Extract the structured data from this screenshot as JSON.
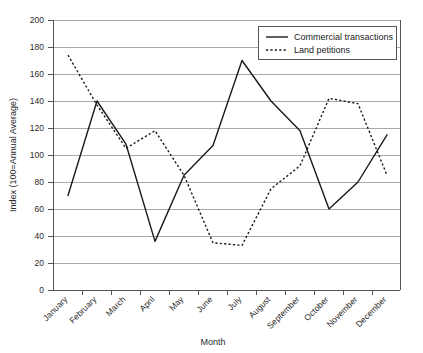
{
  "chart_data": {
    "type": "line",
    "title": "",
    "xlabel": "Month",
    "ylabel": "Index (100=Annual Average)",
    "categories": [
      "January",
      "February",
      "March",
      "April",
      "May",
      "June",
      "July",
      "August",
      "September",
      "October",
      "November",
      "December"
    ],
    "series": [
      {
        "name": "Commercial transactions",
        "style": "solid",
        "values": [
          70,
          140,
          108,
          36,
          85,
          107,
          170,
          140,
          118,
          60,
          80,
          115
        ]
      },
      {
        "name": "Land petitions",
        "style": "dotted",
        "values": [
          174,
          137,
          105,
          118,
          85,
          35,
          33,
          75,
          92,
          142,
          138,
          85
        ]
      }
    ],
    "ylim": [
      0,
      200
    ],
    "ytick_step": 20,
    "yticks": [
      "0",
      "20",
      "40",
      "60",
      "80",
      "100",
      "120",
      "140",
      "160",
      "180",
      "200"
    ],
    "grid": "horizontal",
    "legend_position": "top-right",
    "colors": {
      "series_line": "#1a1a1a",
      "gridline": "#a9a9a9",
      "axis": "#555555",
      "background": "#ffffff",
      "text": "#2b2b2b"
    }
  }
}
